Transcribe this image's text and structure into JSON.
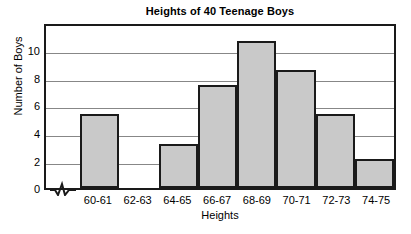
{
  "chart_data": {
    "type": "bar",
    "title": "Heights of 40 Teenage Boys",
    "xlabel": "Heights",
    "ylabel": "Number of Boys",
    "categories": [
      "60-61",
      "62-63",
      "64-65",
      "66-67",
      "68-69",
      "70-71",
      "72-73",
      "74-75"
    ],
    "values": [
      5,
      0,
      3,
      7,
      10,
      8,
      5,
      2
    ],
    "ylim": [
      0,
      11
    ],
    "yticks": [
      0,
      2,
      4,
      6,
      8,
      10
    ],
    "ytick_labels": [
      "0",
      "2",
      "4",
      "6",
      "8",
      "10"
    ],
    "grid": true,
    "grid_axis": "y",
    "legend": null,
    "bar_fill_color": "#c9c9c9",
    "bar_edge_color": "#1a1a1a",
    "axis_break": "zigzag-x-origin"
  },
  "chart": {
    "title": "Heights of 40 Teenage Boys",
    "xlabel": "Heights",
    "ylabel": "Number of Boys",
    "ytick_labels": [
      "10",
      "8",
      "6",
      "4",
      "2",
      "0"
    ],
    "xtick_labels": [
      "60-61",
      "62-63",
      "64-65",
      "66-67",
      "68-69",
      "70-71",
      "72-73",
      "74-75"
    ],
    "axis_break_icon": "zigzag-break-icon"
  }
}
